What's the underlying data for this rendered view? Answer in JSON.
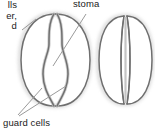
{
  "figure": {
    "background_color": "#ffffff"
  },
  "labels": {
    "stoma": "stoma",
    "guard_cells": "guard cells",
    "cutoff_fragment_line1": "lls",
    "cutoff_fragment_line2": "er,",
    "cutoff_fragment_line3": "d"
  },
  "diagrams": [
    {
      "name": "open-stoma",
      "state": "open",
      "description": "Two curved guard cells bowed apart leaving an open lens-shaped pore between them"
    },
    {
      "name": "closed-stoma",
      "state": "closed",
      "description": "Two guard cells pressed together with a narrow straight closed pore between them"
    }
  ],
  "colors": {
    "outline": "#6f6f6f",
    "inner_line": "#8a8a8a",
    "cell_fill": "#ffffff",
    "wall_fill": "#d8d8d8",
    "halo": "#e9e9e9",
    "leader_line": "#9a9a9a",
    "text": "#1a1a1a"
  }
}
